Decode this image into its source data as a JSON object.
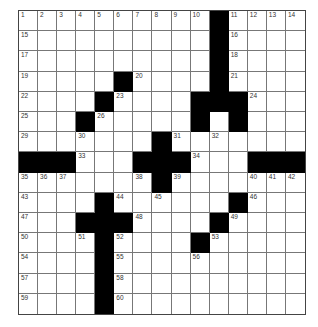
{
  "puzzle": {
    "rows": 15,
    "cols": 15,
    "layout": [
      "..........#....",
      "..........#....",
      "..........#....",
      ".....#....#....",
      "....#....###...",
      "...#.....#.#...",
      ".......#.......",
      "###...###...###",
      ".......#.......",
      "....#......#...",
      "...###....#....",
      "....#....#.....",
      "....#..........",
      "....#..........",
      "....#.........."
    ],
    "numbers": [
      {
        "r": 0,
        "c": 0,
        "n": "1"
      },
      {
        "r": 0,
        "c": 1,
        "n": "2"
      },
      {
        "r": 0,
        "c": 2,
        "n": "3"
      },
      {
        "r": 0,
        "c": 3,
        "n": "4"
      },
      {
        "r": 0,
        "c": 4,
        "n": "5"
      },
      {
        "r": 0,
        "c": 5,
        "n": "6"
      },
      {
        "r": 0,
        "c": 6,
        "n": "7"
      },
      {
        "r": 0,
        "c": 7,
        "n": "8"
      },
      {
        "r": 0,
        "c": 8,
        "n": "9"
      },
      {
        "r": 0,
        "c": 9,
        "n": "10"
      },
      {
        "r": 0,
        "c": 11,
        "n": "11"
      },
      {
        "r": 0,
        "c": 12,
        "n": "12"
      },
      {
        "r": 0,
        "c": 13,
        "n": "13"
      },
      {
        "r": 0,
        "c": 14,
        "n": "14"
      },
      {
        "r": 1,
        "c": 0,
        "n": "15"
      },
      {
        "r": 1,
        "c": 11,
        "n": "16"
      },
      {
        "r": 2,
        "c": 0,
        "n": "17"
      },
      {
        "r": 2,
        "c": 11,
        "n": "18"
      },
      {
        "r": 3,
        "c": 0,
        "n": "19"
      },
      {
        "r": 3,
        "c": 6,
        "n": "20"
      },
      {
        "r": 3,
        "c": 11,
        "n": "21"
      },
      {
        "r": 4,
        "c": 0,
        "n": "22"
      },
      {
        "r": 4,
        "c": 5,
        "n": "23"
      },
      {
        "r": 4,
        "c": 12,
        "n": "24"
      },
      {
        "r": 5,
        "c": 0,
        "n": "25"
      },
      {
        "r": 5,
        "c": 4,
        "n": "26"
      },
      {
        "r": 5,
        "c": 9,
        "n": "27"
      },
      {
        "r": 5,
        "c": 11,
        "n": "28"
      },
      {
        "r": 6,
        "c": 0,
        "n": "29"
      },
      {
        "r": 6,
        "c": 3,
        "n": "30"
      },
      {
        "r": 6,
        "c": 8,
        "n": "31"
      },
      {
        "r": 6,
        "c": 10,
        "n": "32"
      },
      {
        "r": 7,
        "c": 3,
        "n": "33"
      },
      {
        "r": 7,
        "c": 9,
        "n": "34"
      },
      {
        "r": 8,
        "c": 0,
        "n": "35"
      },
      {
        "r": 8,
        "c": 1,
        "n": "36"
      },
      {
        "r": 8,
        "c": 2,
        "n": "37"
      },
      {
        "r": 8,
        "c": 6,
        "n": "38"
      },
      {
        "r": 8,
        "c": 8,
        "n": "39"
      },
      {
        "r": 8,
        "c": 12,
        "n": "40"
      },
      {
        "r": 8,
        "c": 13,
        "n": "41"
      },
      {
        "r": 8,
        "c": 14,
        "n": "42"
      },
      {
        "r": 9,
        "c": 0,
        "n": "43"
      },
      {
        "r": 9,
        "c": 5,
        "n": "44"
      },
      {
        "r": 9,
        "c": 7,
        "n": "45"
      },
      {
        "r": 9,
        "c": 12,
        "n": "46"
      },
      {
        "r": 10,
        "c": 0,
        "n": "47"
      },
      {
        "r": 10,
        "c": 6,
        "n": "48"
      },
      {
        "r": 10,
        "c": 11,
        "n": "49"
      },
      {
        "r": 11,
        "c": 0,
        "n": "50"
      },
      {
        "r": 11,
        "c": 3,
        "n": "51"
      },
      {
        "r": 11,
        "c": 5,
        "n": "52"
      },
      {
        "r": 11,
        "c": 10,
        "n": "53"
      },
      {
        "r": 12,
        "c": 0,
        "n": "54"
      },
      {
        "r": 12,
        "c": 5,
        "n": "55"
      },
      {
        "r": 12,
        "c": 9,
        "n": "56"
      },
      {
        "r": 13,
        "c": 0,
        "n": "57"
      },
      {
        "r": 13,
        "c": 5,
        "n": "58"
      },
      {
        "r": 14,
        "c": 0,
        "n": "59"
      },
      {
        "r": 14,
        "c": 5,
        "n": "60"
      }
    ]
  }
}
